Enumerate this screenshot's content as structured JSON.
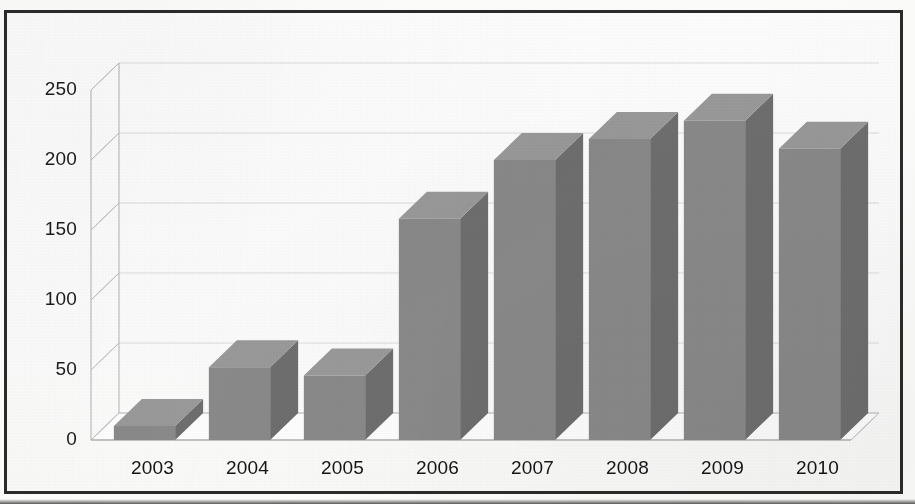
{
  "figure": {
    "kind": "3d-column-chart",
    "frame_border_color": "#2b2b2b",
    "page_background": "#ffffff"
  },
  "chart_data": {
    "type": "bar",
    "title": "",
    "subtitle": "",
    "xlabel": "",
    "ylabel": "",
    "categories": [
      "2003",
      "2004",
      "2005",
      "2006",
      "2007",
      "2008",
      "2009",
      "2010"
    ],
    "values": [
      10,
      52,
      46,
      158,
      200,
      215,
      228,
      208
    ],
    "ylim": [
      0,
      250
    ],
    "yticks": [
      0,
      50,
      100,
      150,
      200,
      250
    ],
    "ytick_labels": [
      "0",
      "50",
      "100",
      "150",
      "200",
      "250"
    ],
    "grid": true,
    "grid_axis": "y",
    "legend": false,
    "legend_position": "none",
    "series": [
      {
        "name": "",
        "values": [
          10,
          52,
          46,
          158,
          200,
          215,
          228,
          208
        ]
      }
    ],
    "style": {
      "three_d": true,
      "bar_face_color": "#8a8a8a",
      "bar_side_color": "#6f6f6f",
      "bar_top_color": "#9a9a9a",
      "grid_color": "#d7d7d7",
      "axis_color": "#bdbdbd",
      "text_color": "#161616"
    }
  }
}
